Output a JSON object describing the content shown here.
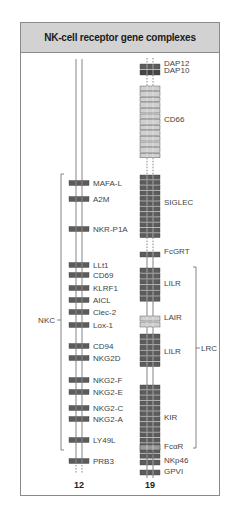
{
  "title": "NK-cell receptor gene complexes",
  "colors": {
    "dark_gene": "#5c5c5c",
    "light_gene": "#cfcfcf",
    "mid_gene": "#9a9a9a",
    "header_bg": "#d2d2d2",
    "line": "#666666"
  },
  "chromosomes": [
    {
      "id": "chr12",
      "label": "12",
      "genes": [
        {
          "name": "MAFA-L",
          "shade": "dark"
        },
        {
          "name": "A2M",
          "shade": "dark"
        },
        {
          "name": "NKR-P1A",
          "shade": "dark"
        },
        {
          "name": "LLt1",
          "shade": "dark"
        },
        {
          "name": "CD69",
          "shade": "dark"
        },
        {
          "name": "KLRF1",
          "shade": "dark"
        },
        {
          "name": "AICL",
          "shade": "dark"
        },
        {
          "name": "Clec-2",
          "shade": "dark"
        },
        {
          "name": "Lox-1",
          "shade": "dark"
        },
        {
          "name": "CD94",
          "shade": "dark"
        },
        {
          "name": "NKG2D",
          "shade": "dark"
        },
        {
          "name": "NKG2-F",
          "shade": "dark"
        },
        {
          "name": "NKG2-E",
          "shade": "dark"
        },
        {
          "name": "NKG2-C",
          "shade": "dark"
        },
        {
          "name": "NKG2-A",
          "shade": "dark"
        },
        {
          "name": "LY49L",
          "shade": "dark"
        },
        {
          "name": "PRB3",
          "shade": "dark"
        }
      ],
      "complex": {
        "label": "NKC",
        "side": "left",
        "from": "MAFA-L",
        "to": "LY49L"
      }
    },
    {
      "id": "chr19",
      "label": "19",
      "groups": [
        {
          "name": "DAP12",
          "count": 1,
          "shade": "dark"
        },
        {
          "name": "DAP10",
          "count": 1,
          "shade": "darker"
        },
        {
          "name": "CD66",
          "count": 13,
          "shade": "light"
        },
        {
          "name": "SIGLEC",
          "count": 12,
          "shade": "dark"
        },
        {
          "name": "FcGRT",
          "count": 1,
          "shade": "dark"
        },
        {
          "name": "LILR",
          "count": 6,
          "shade": "dark"
        },
        {
          "name": "LAIR",
          "count": 2,
          "shade": "light"
        },
        {
          "name": "LILR",
          "count": 6,
          "shade": "dark"
        },
        {
          "name": "KIR",
          "count": 14,
          "shade": "dark"
        },
        {
          "name": "FcαR",
          "count": 1,
          "shade": "mid"
        },
        {
          "name": "NKp46",
          "count": 1,
          "shade": "dark"
        },
        {
          "name": "GPVI",
          "count": 1,
          "shade": "dark"
        }
      ],
      "complex": {
        "label": "LRC",
        "side": "right",
        "from": "LILR",
        "to": "FcαR"
      }
    }
  ]
}
